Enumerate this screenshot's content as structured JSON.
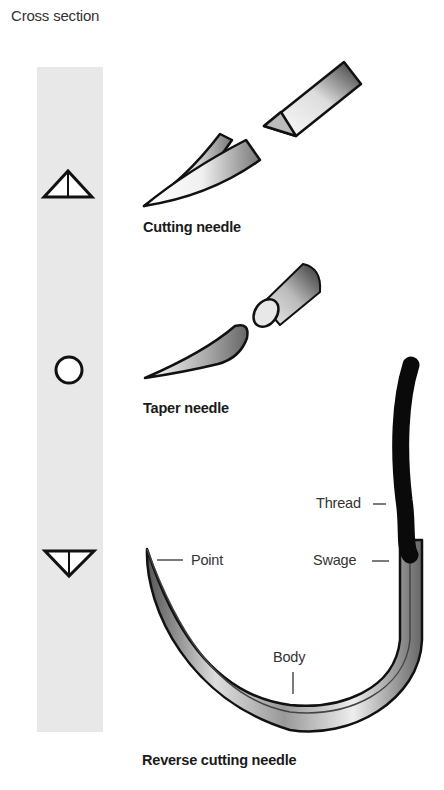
{
  "header": {
    "title": "Cross section"
  },
  "cross_section_column": {
    "color": "#e8e8e8",
    "symbols": [
      {
        "name": "triangle-apex-up",
        "needle": "Cutting needle"
      },
      {
        "name": "circle",
        "needle": "Taper needle"
      },
      {
        "name": "triangle-apex-down",
        "needle": "Reverse cutting needle"
      }
    ]
  },
  "needles": [
    {
      "caption": "Cutting needle"
    },
    {
      "caption": "Taper needle"
    },
    {
      "caption": "Reverse cutting needle",
      "labels": {
        "point": "Point",
        "body": "Body",
        "swage": "Swage",
        "thread": "Thread"
      }
    }
  ]
}
